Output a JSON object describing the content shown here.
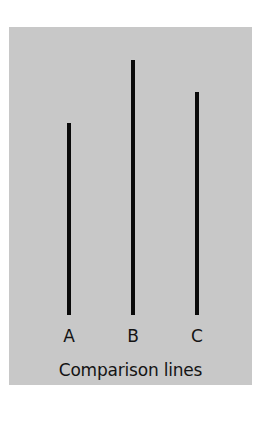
{
  "figure": {
    "caption": "Comparison lines",
    "background_color": "#c8c8c8",
    "line_color": "#0a0a0a",
    "lines": [
      {
        "label": "A",
        "x": 69,
        "top": 123,
        "bottom": 315
      },
      {
        "label": "B",
        "x": 133,
        "top": 60,
        "bottom": 315
      },
      {
        "label": "C",
        "x": 197,
        "top": 92,
        "bottom": 315
      }
    ]
  },
  "chart_data": {
    "type": "bar",
    "title": "Comparison lines",
    "categories": [
      "A",
      "B",
      "C"
    ],
    "values": [
      192,
      255,
      223
    ],
    "xlabel": "",
    "ylabel": "",
    "units": "px (relative length)",
    "grid": false,
    "legend": "none"
  }
}
